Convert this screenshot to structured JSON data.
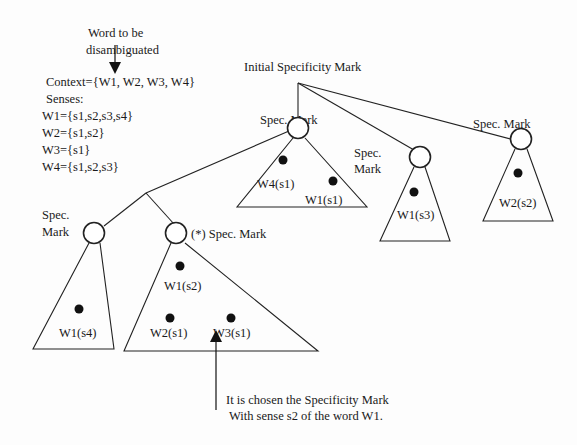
{
  "word_label": {
    "line1": "Word to be",
    "line2": "disambiguated"
  },
  "context": {
    "title": "Context={W1, W2, W3, W4}",
    "senses_label": "Senses:",
    "senses": [
      "W1={s1,s2,s3,s4}",
      "W2={s1,s2}",
      "W3={s1}",
      "W4={s1,s2,s3}"
    ]
  },
  "root": {
    "label": "Initial Specificity Mark"
  },
  "marks": {
    "middle": "Spec. Mark",
    "w1s3_line1": "Spec.",
    "w1s3_line2": "Mark",
    "right": "Spec. Mark",
    "left_line1": "Spec.",
    "left_line2": "Mark",
    "chosen": "(*) Spec. Mark"
  },
  "leaves": {
    "w4s1": "W4(s1)",
    "w1s1": "W1(s1)",
    "w1s3": "W1(s3)",
    "w2s2": "W2(s2)",
    "w1s4": "W1(s4)",
    "w1s2": "W1(s2)",
    "w2s1": "W2(s1)",
    "w3s1": "W3(s1)"
  },
  "note": {
    "line1": "It is chosen the Specificity Mark",
    "line2": "With sense s2 of the word W1."
  }
}
